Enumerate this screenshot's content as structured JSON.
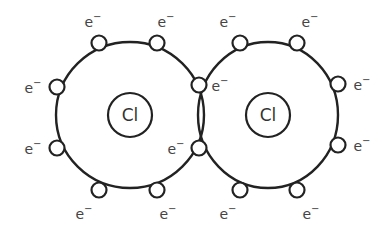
{
  "diagram": {
    "type": "dot-and-cross covalent bond",
    "molecule": "Cl2",
    "colors": {
      "stroke": "#222222",
      "text": "#444444",
      "background": "#ffffff"
    },
    "atoms": [
      {
        "symbol": "Cl",
        "nucleus": {
          "cx": 130,
          "cy": 115,
          "r": 22
        },
        "shell": {
          "cx": 130,
          "cy": 115,
          "rx": 74,
          "ry": 73
        }
      },
      {
        "symbol": "Cl",
        "nucleus": {
          "cx": 268,
          "cy": 115,
          "r": 22
        },
        "shell": {
          "cx": 268,
          "cy": 115,
          "rx": 70,
          "ry": 73
        }
      }
    ],
    "electron_label": "e",
    "electron_charge": "−",
    "electrons": [
      {
        "atom": "left",
        "cx": 99,
        "cy": 43,
        "label_x": 93,
        "label_y": 22
      },
      {
        "atom": "left",
        "cx": 157,
        "cy": 43,
        "label_x": 166,
        "label_y": 22
      },
      {
        "atom": "left",
        "cx": 57,
        "cy": 87,
        "label_x": 33,
        "label_y": 88
      },
      {
        "atom": "left",
        "cx": 57,
        "cy": 148,
        "label_x": 33,
        "label_y": 149
      },
      {
        "atom": "left",
        "cx": 99,
        "cy": 190,
        "label_x": 84,
        "label_y": 214
      },
      {
        "atom": "left",
        "cx": 157,
        "cy": 190,
        "label_x": 168,
        "label_y": 214
      },
      {
        "atom": "shared",
        "cx": 199,
        "cy": 85,
        "label_x": 220,
        "label_y": 86
      },
      {
        "atom": "shared",
        "cx": 199,
        "cy": 148,
        "label_x": 176,
        "label_y": 149
      },
      {
        "atom": "right",
        "cx": 240,
        "cy": 43,
        "label_x": 228,
        "label_y": 22
      },
      {
        "atom": "right",
        "cx": 297,
        "cy": 43,
        "label_x": 310,
        "label_y": 22
      },
      {
        "atom": "right",
        "cx": 338,
        "cy": 84,
        "label_x": 362,
        "label_y": 85
      },
      {
        "atom": "right",
        "cx": 338,
        "cy": 145,
        "label_x": 362,
        "label_y": 146
      },
      {
        "atom": "right",
        "cx": 240,
        "cy": 190,
        "label_x": 228,
        "label_y": 214
      },
      {
        "atom": "right",
        "cx": 297,
        "cy": 190,
        "label_x": 311,
        "label_y": 214
      }
    ],
    "electron_radius": 7.5
  }
}
